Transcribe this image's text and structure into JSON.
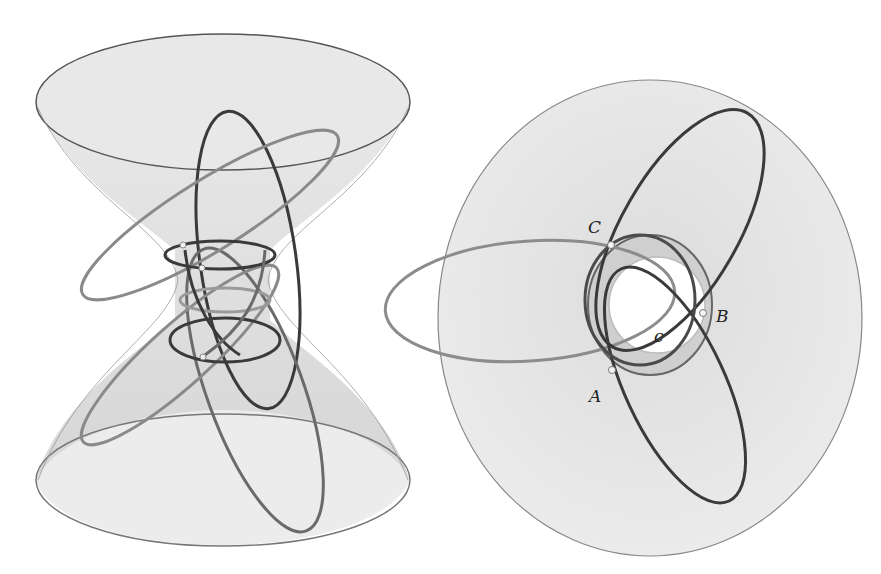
{
  "figure": {
    "left_panel": {
      "description": "Hyperboloid of one sheet (hourglass) with intersecting conic curves",
      "colors": {
        "surface": "#d9d9d9",
        "curve_dark": "#3a3a3a",
        "curve_mid": "#7a7a7a",
        "curve_light": "#a8a8a8"
      }
    },
    "right_panel": {
      "description": "Top view of disk with three ellipses meeting at points A, B, C around inner circle c",
      "labels": {
        "A": "A",
        "B": "B",
        "C": "C",
        "c": "c"
      },
      "colors": {
        "disk": "#e6e6e6",
        "inner": "#ffffff",
        "curve_dark": "#3a3a3a",
        "curve_light": "#9a9a9a"
      }
    }
  }
}
